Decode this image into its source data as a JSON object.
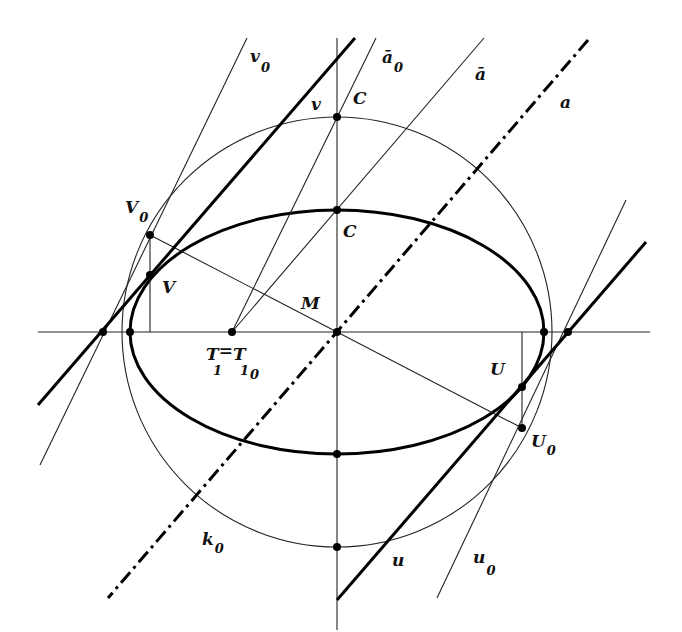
{
  "figure": {
    "labels": {
      "v0": {
        "main": "v",
        "sub": "0"
      },
      "a_bar0": {
        "main": "ā",
        "sub": "0"
      },
      "a_bar": {
        "main": "ā",
        "sub": ""
      },
      "a": {
        "main": "a",
        "sub": ""
      },
      "v": {
        "main": "v",
        "sub": ""
      },
      "C_top": {
        "main": "C",
        "sub": ""
      },
      "C_mid": {
        "main": "C",
        "sub": ""
      },
      "V0": {
        "main": "V",
        "sub": "0"
      },
      "V": {
        "main": "V",
        "sub": ""
      },
      "M": {
        "main": "M",
        "sub": ""
      },
      "T1": {
        "main": "T",
        "sub": "1",
        "eq": "=",
        "main2": "T",
        "sub2": "1",
        "sub3": "0"
      },
      "U": {
        "main": "U",
        "sub": ""
      },
      "U0": {
        "main": "U",
        "sub": "0"
      },
      "k0": {
        "main": "k",
        "sub": "0"
      },
      "u": {
        "main": "u",
        "sub": ""
      },
      "u0": {
        "main": "u",
        "sub": "0"
      }
    },
    "elements": {
      "circle": "k0",
      "ellipse": "affine image of k0",
      "axis_of_affinity": "a (dash-dot)",
      "tangents": [
        "v",
        "v0",
        "u",
        "u0"
      ],
      "points": [
        "M",
        "C",
        "C0",
        "V",
        "V0",
        "U",
        "U0",
        "T1"
      ]
    }
  }
}
